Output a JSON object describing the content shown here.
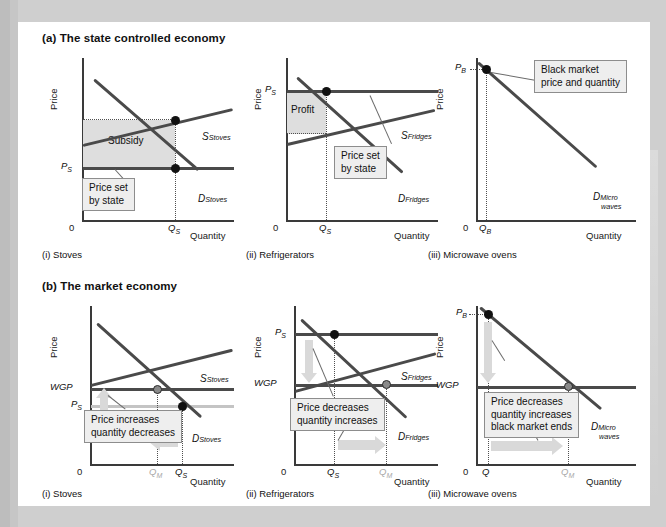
{
  "figure": {
    "sections": [
      {
        "id": "a",
        "title": "(a) The state controlled economy"
      },
      {
        "id": "b",
        "title": "(b) The market economy"
      }
    ],
    "axis": {
      "price_label": "Price",
      "quantity_label": "Quantity",
      "origin_label": "0"
    }
  },
  "panels": {
    "a1": {
      "caption": "(i) Stoves",
      "supply_label": "S",
      "supply_sub": "Stoves",
      "demand_label": "D",
      "demand_sub": "Stoves",
      "price_axis_value": "P",
      "price_axis_sub": "S",
      "qty_axis_value": "Q",
      "qty_axis_sub": "S",
      "shade_label": "Subsidy",
      "callout": "Price set\nby state"
    },
    "a2": {
      "caption": "(ii) Refrigerators",
      "supply_label": "S",
      "supply_sub": "Fridges",
      "demand_label": "D",
      "demand_sub": "Fridges",
      "price_axis_value": "P",
      "price_axis_sub": "S",
      "qty_axis_value": "Q",
      "qty_axis_sub": "S",
      "shade_label": "Profit",
      "callout": "Price set\nby state"
    },
    "a3": {
      "caption": "(iii) Microwave ovens",
      "demand_label": "D",
      "demand_sub": "Micro",
      "demand_sub2": "waves",
      "price_axis_value": "P",
      "price_axis_sub": "B",
      "qty_axis_value": "Q",
      "qty_axis_sub": "B",
      "callout": "Black market\nprice and quantity"
    },
    "b1": {
      "caption": "(i) Stoves",
      "supply_label": "S",
      "supply_sub": "Stoves",
      "demand_label": "D",
      "demand_sub": "Stoves",
      "wgp_label": "WGP",
      "ps_label": "P",
      "ps_sub": "S",
      "qm_label": "Q",
      "qm_sub": "M",
      "qs_label": "Q",
      "qs_sub": "S",
      "callout": "Price increases\nquantity decreases"
    },
    "b2": {
      "caption": "(ii) Refrigerators",
      "supply_label": "S",
      "supply_sub": "Fridges",
      "demand_label": "D",
      "demand_sub": "Fridges",
      "wgp_label": "WGP",
      "ps_label": "P",
      "ps_sub": "S",
      "qs_label": "Q",
      "qs_sub": "S",
      "qm_label": "Q",
      "qm_sub": "M",
      "callout": "Price decreases\nquantity increases"
    },
    "b3": {
      "caption": "(iii) Microwave ovens",
      "demand_label": "D",
      "demand_sub": "Micro",
      "demand_sub2": "waves",
      "wgp_label": "WGP",
      "pb_label": "P",
      "pb_sub": "B",
      "qb_label": "Q",
      "qb_sub": "B",
      "qm_label": "Q",
      "qm_sub": "M",
      "callout": "Price decreases\nquantity increases\nblack market ends"
    }
  },
  "chart_data": [
    {
      "type": "line",
      "id": "a-i-stoves",
      "title": "(i) Stoves — state controlled economy",
      "xlabel": "Quantity",
      "ylabel": "Price",
      "series": [
        {
          "name": "S Stoves",
          "role": "supply",
          "slope": "upward",
          "points": [
            [
              0.05,
              0.46
            ],
            [
              1.0,
              0.7
            ]
          ]
        },
        {
          "name": "D Stoves",
          "role": "demand",
          "slope": "downward",
          "points": [
            [
              0.15,
              0.92
            ],
            [
              0.95,
              0.18
            ]
          ]
        },
        {
          "name": "P S (price set by state)",
          "role": "price-floor-line",
          "points": [
            [
              0.0,
              0.4
            ],
            [
              1.0,
              0.4
            ]
          ]
        }
      ],
      "markers": [
        {
          "label": "supply at Qs",
          "x": 0.7,
          "y": 0.655,
          "style": "filled"
        },
        {
          "label": "demand at Qs",
          "x": 0.7,
          "y": 0.4,
          "style": "filled"
        }
      ],
      "shaded_region": {
        "label": "Subsidy",
        "x": [
          0.0,
          0.7
        ],
        "y": [
          0.4,
          0.655
        ]
      },
      "annotations": [
        "Price set by state"
      ],
      "tick_labels": {
        "y": [
          "P S"
        ],
        "x": [
          "Q S"
        ],
        "origin": "0"
      }
    },
    {
      "type": "line",
      "id": "a-ii-refrigerators",
      "title": "(ii) Refrigerators — state controlled economy",
      "xlabel": "Quantity",
      "ylabel": "Price",
      "series": [
        {
          "name": "S Fridges",
          "role": "supply",
          "slope": "upward",
          "points": [
            [
              0.03,
              0.44
            ],
            [
              1.0,
              0.68
            ]
          ]
        },
        {
          "name": "D Fridges",
          "role": "demand",
          "slope": "downward",
          "points": [
            [
              0.13,
              0.93
            ],
            [
              0.96,
              0.15
            ]
          ]
        },
        {
          "name": "P S (price set by state)",
          "role": "price-ceiling-line",
          "points": [
            [
              0.0,
              0.83
            ],
            [
              1.0,
              0.83
            ]
          ]
        }
      ],
      "markers": [
        {
          "label": "demand at Qs",
          "x": 0.3,
          "y": 0.83,
          "style": "filled"
        }
      ],
      "shaded_region": {
        "label": "Profit",
        "x": [
          0.0,
          0.3
        ],
        "y": [
          0.505,
          0.83
        ]
      },
      "annotations": [
        "Price set by state"
      ],
      "tick_labels": {
        "y": [
          "P S"
        ],
        "x": [
          "Q S"
        ],
        "origin": "0"
      }
    },
    {
      "type": "line",
      "id": "a-iii-microwave-ovens",
      "title": "(iii) Microwave ovens — state controlled economy",
      "xlabel": "Quantity",
      "ylabel": "Price",
      "series": [
        {
          "name": "D Micro waves",
          "role": "demand",
          "slope": "downward",
          "points": [
            [
              0.03,
              0.95
            ],
            [
              0.95,
              0.18
            ]
          ]
        }
      ],
      "markers": [
        {
          "label": "black market equilibrium",
          "x": 0.09,
          "y": 0.9,
          "style": "filled"
        }
      ],
      "annotations": [
        "Black market price and quantity"
      ],
      "tick_labels": {
        "y": [
          "P B"
        ],
        "x": [
          "Q B"
        ],
        "origin": "0"
      }
    },
    {
      "type": "line",
      "id": "b-i-stoves",
      "title": "(i) Stoves — market economy",
      "xlabel": "Quantity",
      "ylabel": "Price",
      "series": [
        {
          "name": "S Stoves",
          "role": "supply",
          "slope": "upward",
          "points": [
            [
              0.02,
              0.48
            ],
            [
              1.0,
              0.73
            ]
          ]
        },
        {
          "name": "D Stoves",
          "role": "demand",
          "slope": "downward",
          "points": [
            [
              0.14,
              0.94
            ],
            [
              0.98,
              0.17
            ]
          ]
        },
        {
          "name": "WGP (world given price)",
          "role": "world-price",
          "points": [
            [
              0.0,
              0.45
            ],
            [
              1.0,
              0.45
            ]
          ]
        },
        {
          "name": "P S (old state price)",
          "role": "old-price",
          "points": [
            [
              0.0,
              0.345
            ],
            [
              1.0,
              0.345
            ]
          ]
        }
      ],
      "markers": [
        {
          "label": "market equilibrium Qm",
          "x": 0.6,
          "y": 0.45,
          "style": "open"
        },
        {
          "label": "old state quantity Qs",
          "x": 0.72,
          "y": 0.345,
          "style": "filled"
        }
      ],
      "arrows": [
        {
          "direction": "up",
          "meaning": "price increases"
        },
        {
          "direction": "left",
          "meaning": "quantity decreases"
        }
      ],
      "annotations": [
        "Price increases quantity decreases"
      ],
      "tick_labels": {
        "y": [
          "WGP",
          "P S"
        ],
        "x": [
          "Q M",
          "Q S"
        ],
        "origin": "0"
      }
    },
    {
      "type": "line",
      "id": "b-ii-refrigerators",
      "title": "(ii) Refrigerators — market economy",
      "xlabel": "Quantity",
      "ylabel": "Price",
      "series": [
        {
          "name": "S Fridges",
          "role": "supply",
          "slope": "upward",
          "points": [
            [
              0.02,
              0.43
            ],
            [
              1.0,
              0.7
            ]
          ]
        },
        {
          "name": "D Fridges",
          "role": "demand",
          "slope": "downward",
          "points": [
            [
              0.13,
              0.95
            ],
            [
              0.98,
              0.17
            ]
          ]
        },
        {
          "name": "P S (old state price)",
          "role": "old-price",
          "points": [
            [
              0.0,
              0.8
            ],
            [
              1.0,
              0.8
            ]
          ]
        },
        {
          "name": "WGP (world given price)",
          "role": "world-price",
          "points": [
            [
              0.0,
              0.52
            ],
            [
              1.0,
              0.52
            ]
          ]
        }
      ],
      "markers": [
        {
          "label": "old state quantity Qs",
          "x": 0.3,
          "y": 0.8,
          "style": "filled"
        },
        {
          "label": "market equilibrium Qm",
          "x": 0.6,
          "y": 0.52,
          "style": "open"
        }
      ],
      "arrows": [
        {
          "direction": "down",
          "meaning": "price decreases"
        },
        {
          "direction": "right",
          "meaning": "quantity increases"
        }
      ],
      "annotations": [
        "Price decreases quantity increases"
      ],
      "tick_labels": {
        "y": [
          "P S",
          "WGP"
        ],
        "x": [
          "Q S",
          "Q M"
        ],
        "origin": "0"
      }
    },
    {
      "type": "line",
      "id": "b-iii-microwave-ovens",
      "title": "(iii) Microwave ovens — market economy",
      "xlabel": "Quantity",
      "ylabel": "Price",
      "series": [
        {
          "name": "D Micro waves",
          "role": "demand",
          "slope": "downward",
          "points": [
            [
              0.03,
              0.96
            ],
            [
              0.97,
              0.18
            ]
          ]
        },
        {
          "name": "WGP (world given price)",
          "role": "world-price",
          "points": [
            [
              0.0,
              0.5
            ],
            [
              1.0,
              0.5
            ]
          ]
        }
      ],
      "markers": [
        {
          "label": "black market point Qb",
          "x": 0.09,
          "y": 0.915,
          "style": "filled"
        },
        {
          "label": "market equilibrium Qm",
          "x": 0.62,
          "y": 0.5,
          "style": "open"
        }
      ],
      "arrows": [
        {
          "direction": "down",
          "meaning": "price decreases"
        },
        {
          "direction": "right",
          "meaning": "quantity increases"
        }
      ],
      "annotations": [
        "Price decreases quantity increases black market ends"
      ],
      "tick_labels": {
        "y": [
          "P B",
          "WGP"
        ],
        "x": [
          "Q",
          "Q M"
        ],
        "origin": "0"
      }
    }
  ]
}
